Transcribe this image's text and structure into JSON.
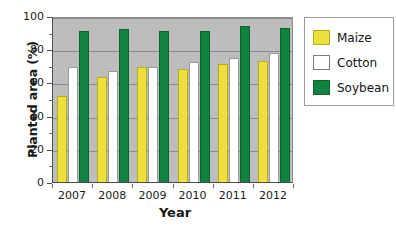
{
  "chart_data": {
    "type": "bar",
    "title": "",
    "xlabel": "Year",
    "ylabel": "Planted area (%)",
    "categories": [
      "2007",
      "2008",
      "2009",
      "2010",
      "2011",
      "2012"
    ],
    "ylim": [
      0,
      100
    ],
    "yticks": [
      0,
      20,
      40,
      60,
      80,
      100
    ],
    "ytick_labels": [
      "0",
      "20",
      "40",
      "60",
      "80",
      "100"
    ],
    "grid": true,
    "legend_position": "right",
    "series": [
      {
        "name": "Maize",
        "color": "#ede03c",
        "values": [
          52,
          63,
          69,
          68,
          71,
          73
        ]
      },
      {
        "name": "Cotton",
        "color": "#ffffff",
        "values": [
          69,
          67,
          69,
          72,
          75,
          78
        ]
      },
      {
        "name": "Soybean",
        "color": "#128240",
        "values": [
          91,
          92,
          91,
          91,
          94,
          93
        ]
      }
    ],
    "plot_background": "#bdbdbd"
  },
  "legend": {
    "items": [
      {
        "label": "Maize"
      },
      {
        "label": "Cotton"
      },
      {
        "label": "Soybean"
      }
    ]
  }
}
